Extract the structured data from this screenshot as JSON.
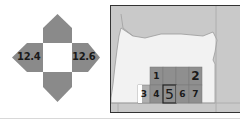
{
  "compass": {
    "left_label": "12.4",
    "right_label": "12.6",
    "arrow_color": "#8a8a8a"
  },
  "map": {
    "region": "Oregon",
    "background_color": "#c9c9c9",
    "state_fill": "#f2f2f2",
    "grid_fill": "#8f8f8f",
    "cells": [
      {
        "id": "1",
        "label": "1"
      },
      {
        "id": "2",
        "label": "2"
      },
      {
        "id": "3",
        "label": "3"
      },
      {
        "id": "4",
        "label": "4"
      },
      {
        "id": "5",
        "label": "5"
      },
      {
        "id": "6",
        "label": "6"
      },
      {
        "id": "7",
        "label": "7"
      }
    ]
  }
}
